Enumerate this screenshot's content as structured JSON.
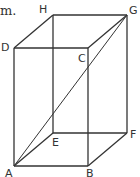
{
  "fragment_text": "m.",
  "figure": {
    "type": "rectangular prism",
    "vertices": {
      "A": {
        "label": "A"
      },
      "B": {
        "label": "B"
      },
      "C": {
        "label": "C"
      },
      "D": {
        "label": "D"
      },
      "E": {
        "label": "E"
      },
      "F": {
        "label": "F"
      },
      "G": {
        "label": "G"
      },
      "H": {
        "label": "H"
      }
    },
    "diagonal": "AG",
    "line_color": "#333333"
  }
}
